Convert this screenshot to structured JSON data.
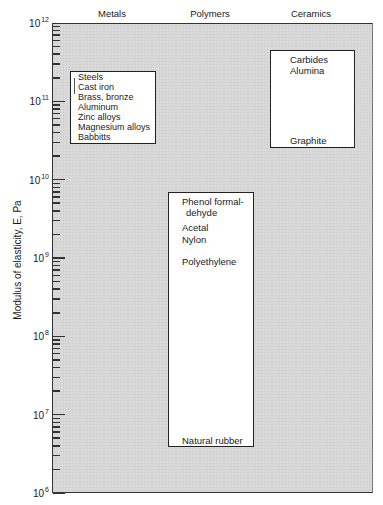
{
  "chart_data": {
    "type": "range-bar",
    "title": "",
    "xlabel": "",
    "ylabel": "Modulus of elasticity, E, Pa",
    "yscale": "log",
    "ylim": [
      1000000.0,
      1000000000000.0
    ],
    "y_ticks": [
      "10^6",
      "10^7",
      "10^8",
      "10^9",
      "10^10",
      "10^11",
      "10^12"
    ],
    "grid": false,
    "categories": [
      "Metals",
      "Polymers",
      "Ceramics"
    ],
    "series": [
      {
        "name": "Metals",
        "range": [
          30000000000.0,
          230000000000.0
        ],
        "members": [
          "Steels",
          "Cast iron",
          "Brass, bronze",
          "Aluminum",
          "Zinc alloys",
          "Magnesium alloys",
          "Babbitts"
        ]
      },
      {
        "name": "Polymers",
        "range": [
          4000000.0,
          7000000000.0
        ],
        "members": [
          "Phenol formaldehyde",
          "Acetal",
          "Nylon",
          "Polyethylene",
          "Natural rubber"
        ]
      },
      {
        "name": "Ceramics",
        "range": [
          26000000000.0,
          450000000000.0
        ],
        "members": [
          "Carbides",
          "Alumina",
          "Graphite"
        ]
      }
    ]
  },
  "labels": {
    "groups": [
      "Metals",
      "Polymers",
      "Ceramics"
    ],
    "yaxis": "Modulus of elasticity, E, Pa",
    "yticks": [
      {
        "base": "10",
        "exp": "12"
      },
      {
        "base": "10",
        "exp": "11"
      },
      {
        "base": "10",
        "exp": "10"
      },
      {
        "base": "10",
        "exp": "9"
      },
      {
        "base": "10",
        "exp": "8"
      },
      {
        "base": "10",
        "exp": "7"
      },
      {
        "base": "10",
        "exp": "6"
      }
    ],
    "metals": [
      "Steels",
      "Cast iron",
      "Brass, bronze",
      "Aluminum",
      "Zinc alloys",
      "Magnesium alloys",
      "Babbitts"
    ],
    "polymers": [
      "Phenol formal-",
      "dehyde",
      "Acetal",
      "Nylon",
      "Polyethylene",
      "Natural rubber"
    ],
    "ceramics": [
      "Carbides",
      "Alumina",
      "Graphite"
    ]
  }
}
